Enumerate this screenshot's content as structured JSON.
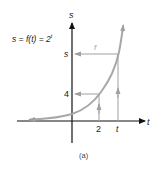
{
  "figure": {
    "equation": "s = f(t) = 2",
    "equation_exponent": "t",
    "caption": "(a)"
  },
  "axes": {
    "x_label": "t",
    "y_label": "s",
    "x_ticks": [
      "2",
      "t"
    ],
    "y_ticks": [
      "4",
      "s"
    ]
  },
  "arrows": {
    "mapping_label": "f"
  },
  "colors": {
    "axis": "#111111",
    "curve": "#a8a8a8",
    "guide": "#a0a0a0"
  }
}
